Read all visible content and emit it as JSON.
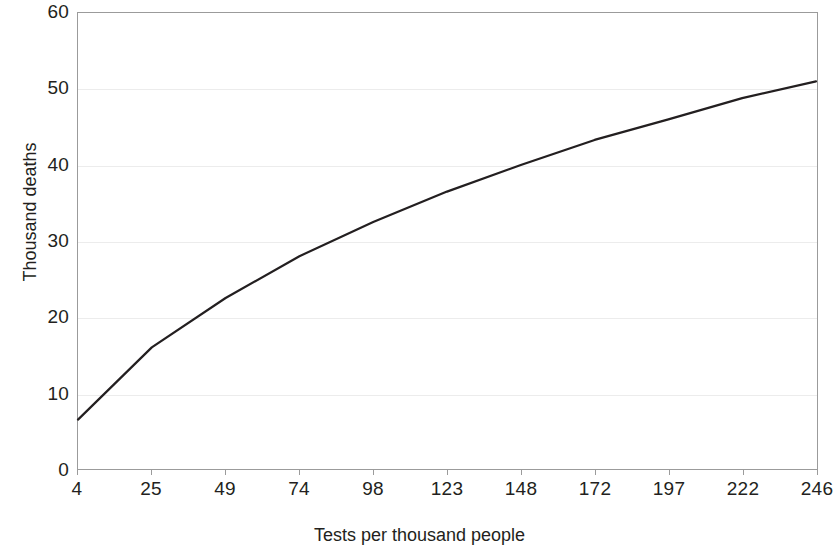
{
  "chart_data": {
    "type": "line",
    "title": "",
    "xlabel": "Tests  per thousand people",
    "ylabel": "Thousand deaths",
    "categories": [
      "4",
      "25",
      "49",
      "74",
      "98",
      "123",
      "148",
      "172",
      "197",
      "222",
      "246"
    ],
    "x": [
      4,
      25,
      49,
      74,
      98,
      123,
      148,
      172,
      197,
      222,
      246
    ],
    "values": [
      6.5,
      16.0,
      22.5,
      28.0,
      32.5,
      36.5,
      40.0,
      43.3,
      46.0,
      48.8,
      51.0
    ],
    "series": [
      {
        "name": "Thousand deaths",
        "color": "#231f20",
        "values": [
          6.5,
          16.0,
          22.5,
          28.0,
          32.5,
          36.5,
          40.0,
          43.3,
          46.0,
          48.8,
          51.0
        ]
      }
    ],
    "ylim": [
      0,
      60
    ],
    "ytick_labels": [
      "60",
      "50",
      "40",
      "30",
      "20",
      "10",
      "0"
    ],
    "yticks": [
      60,
      50,
      40,
      30,
      20,
      10,
      0
    ],
    "grid": true,
    "grid_axis": "y",
    "grid_color": "#ececec",
    "legend": "none",
    "line_color": "#231f20",
    "line_width": 2,
    "frame_color": "#9b9b9b",
    "background": "#ffffff"
  }
}
